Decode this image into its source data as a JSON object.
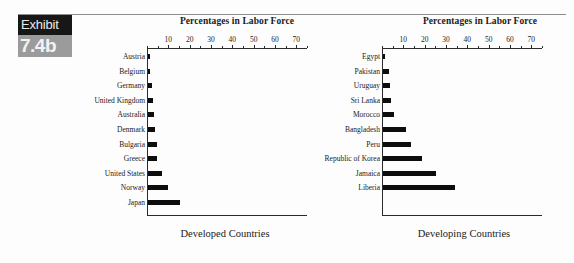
{
  "exhibit": {
    "label": "Exhibit",
    "number": "7.4b"
  },
  "chart_data": [
    {
      "type": "bar",
      "orientation": "horizontal",
      "title": "Percentages in Labor Force",
      "caption": "Developed Countries",
      "xlabel": "",
      "ylabel": "",
      "xlim": [
        0,
        75
      ],
      "xticks": [
        10,
        20,
        30,
        40,
        50,
        60,
        70
      ],
      "grid": false,
      "legend": "none",
      "bar_color": "#0d0d0d",
      "categories": [
        "Austria",
        "Belgium",
        "Germany",
        "United Kingdom",
        "Australia",
        "Denmark",
        "Bulgaria",
        "Greece",
        "United States",
        "Norway",
        "Japan"
      ],
      "values": [
        0.7,
        1.0,
        1.8,
        2.2,
        2.6,
        3.2,
        4.0,
        4.3,
        6.6,
        9.6,
        15.2
      ]
    },
    {
      "type": "bar",
      "orientation": "horizontal",
      "title": "Percentages in Labor Force",
      "caption": "Developing Countries",
      "xlabel": "",
      "ylabel": "",
      "xlim": [
        0,
        75
      ],
      "xticks": [
        10,
        20,
        30,
        40,
        50,
        60,
        70
      ],
      "grid": false,
      "legend": "none",
      "bar_color": "#0d0d0d",
      "categories": [
        "Egypt",
        "Pakistan",
        "Uruguay",
        "Sri Lanka",
        "Morocco",
        "Bangladesh",
        "Peru",
        "Republic of Korea",
        "Jamaica",
        "Liberia"
      ],
      "values": [
        0.6,
        2.9,
        3.1,
        3.6,
        5.2,
        10.8,
        13.0,
        18.2,
        24.8,
        33.6
      ]
    }
  ]
}
